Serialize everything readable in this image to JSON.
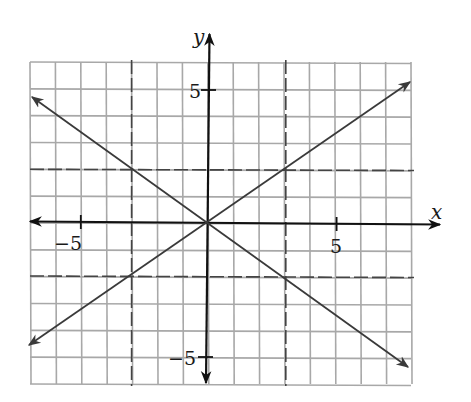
{
  "chart_data": {
    "type": "line",
    "title": "",
    "xlabel": "x",
    "ylabel": "y",
    "xlim": [
      -7,
      8
    ],
    "ylim": [
      -6,
      6
    ],
    "grid": true,
    "grid_step": 1,
    "x_tick_labels": [
      {
        "value": -5,
        "label": "−5"
      },
      {
        "value": 5,
        "label": "5"
      }
    ],
    "y_tick_labels": [
      {
        "value": 5,
        "label": "5"
      },
      {
        "value": -5,
        "label": "−5"
      }
    ],
    "series": [
      {
        "name": "rising line",
        "equation": "y = (2/3)x",
        "style": "solid",
        "arrows": "both",
        "points": [
          {
            "x": -7,
            "y": -4.67
          },
          {
            "x": -3,
            "y": -2
          },
          {
            "x": 0,
            "y": 0
          },
          {
            "x": 3,
            "y": 2
          },
          {
            "x": 8,
            "y": 5.33
          }
        ]
      },
      {
        "name": "falling line",
        "equation": "y = -(2/3)x",
        "style": "solid",
        "arrows": "both",
        "points": [
          {
            "x": -7,
            "y": 4.67
          },
          {
            "x": -3,
            "y": 2
          },
          {
            "x": 0,
            "y": 0
          },
          {
            "x": 3,
            "y": -2
          },
          {
            "x": 8,
            "y": -5.33
          }
        ]
      }
    ],
    "reference_lines": [
      {
        "orientation": "vertical",
        "x": -3,
        "style": "dashed"
      },
      {
        "orientation": "vertical",
        "x": 3,
        "style": "dashed"
      },
      {
        "orientation": "horizontal",
        "y": 2,
        "style": "dashed"
      },
      {
        "orientation": "horizontal",
        "y": -2,
        "style": "dashed"
      }
    ],
    "marked_points": [
      {
        "x": -3,
        "y": 2
      },
      {
        "x": 3,
        "y": 2
      },
      {
        "x": -3,
        "y": -2
      },
      {
        "x": 3,
        "y": -2
      },
      {
        "x": 0,
        "y": 0
      }
    ]
  },
  "labels": {
    "x_axis": "x",
    "y_axis": "y",
    "x_tick_neg5": "−5",
    "x_tick_pos5": "5",
    "y_tick_pos5": "5",
    "y_tick_neg5": "−5"
  },
  "colors": {
    "grid": "#a8a8a8",
    "axis": "#111111",
    "line": "#3a3a3a",
    "dashed": "#555555"
  }
}
